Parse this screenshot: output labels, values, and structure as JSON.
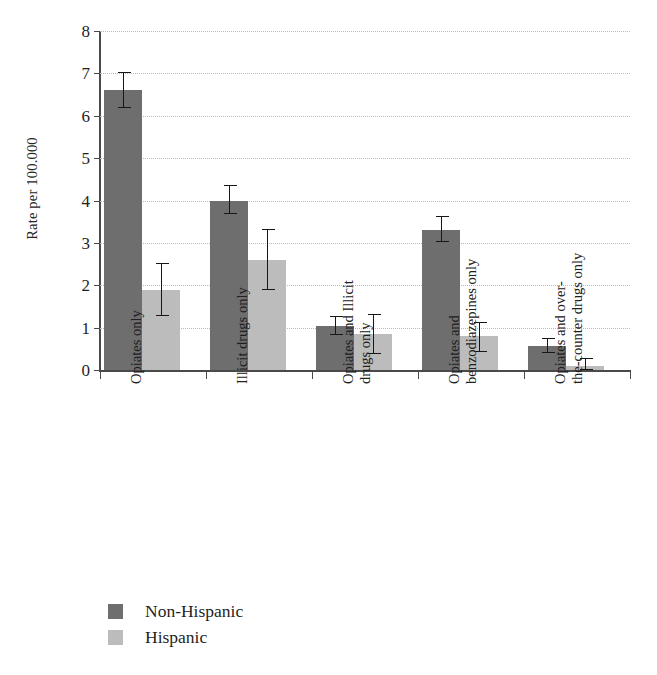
{
  "chart_data": {
    "type": "bar",
    "title": "",
    "xlabel": "",
    "ylabel": "Rate per 100.000",
    "ylim": [
      0,
      8
    ],
    "yticks": [
      0,
      1,
      2,
      3,
      4,
      5,
      6,
      7,
      8
    ],
    "ytick_labels": [
      "0",
      "1",
      "2",
      "3",
      "4",
      "5",
      "6",
      "7",
      "8"
    ],
    "grid": "horizontal-dotted",
    "legend_position": "bottom-left",
    "categories": [
      "Opiates only",
      "Illicit drugs only",
      "Opiates and Illicit\ndrugs only",
      "Opiates and\nbenzodiazepines only",
      "Opiates and over-\nthe-counter drugs only"
    ],
    "series": [
      {
        "name": "Non-Hispanic",
        "color": "#6e6e6e",
        "values": [
          6.6,
          4.0,
          1.05,
          3.3,
          0.57
        ],
        "error_low": [
          6.2,
          3.7,
          0.85,
          3.05,
          0.42
        ],
        "error_high": [
          7.0,
          4.35,
          1.25,
          3.6,
          0.72
        ]
      },
      {
        "name": "Hispanic",
        "color": "#bcbcbc",
        "values": [
          1.9,
          2.6,
          0.85,
          0.8,
          0.1
        ],
        "error_low": [
          1.3,
          1.9,
          0.4,
          0.45,
          0.03
        ],
        "error_high": [
          2.5,
          3.3,
          1.3,
          1.1,
          0.25
        ]
      }
    ]
  },
  "legend": {
    "items": [
      {
        "label": "Non-Hispanic",
        "color": "#6e6e6e"
      },
      {
        "label": "Hispanic",
        "color": "#bcbcbc"
      }
    ]
  }
}
